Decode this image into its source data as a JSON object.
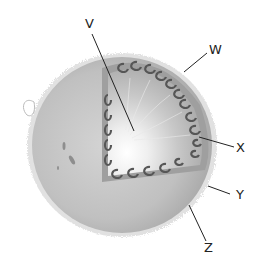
{
  "diagram": {
    "colors": {
      "background": "#ffffff",
      "surface": "#b8b8b8",
      "surface_light": "#d2d2d2",
      "cut_face": "#a9a9a9",
      "convection_ring": "#8a8a8a",
      "cell": "#555555",
      "core": "#ffffff",
      "leader": "#222222"
    },
    "labels": [
      {
        "id": "V",
        "text": "V"
      },
      {
        "id": "W",
        "text": "W"
      },
      {
        "id": "X",
        "text": "X"
      },
      {
        "id": "Y",
        "text": "Y"
      },
      {
        "id": "Z",
        "text": "Z"
      }
    ]
  }
}
